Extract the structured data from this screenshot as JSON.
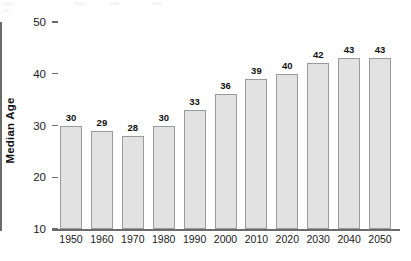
{
  "chart_data": {
    "type": "bar",
    "title": "",
    "xlabel": "",
    "ylabel": "Median Age",
    "categories": [
      "1950",
      "1960",
      "1970",
      "1980",
      "1990",
      "2000",
      "2010",
      "2020",
      "2030",
      "2040",
      "2050"
    ],
    "values": [
      30,
      29,
      28,
      30,
      33,
      36,
      39,
      40,
      42,
      43,
      43
    ],
    "ylim": [
      10,
      50
    ],
    "ytick_labels": [
      "10",
      "20",
      "30",
      "40",
      "50"
    ],
    "ytick_values": [
      10,
      20,
      30,
      40,
      50
    ],
    "grid": false,
    "legend": null,
    "data_labels_shown": true,
    "bar_fill_color": "#e2e2e2",
    "bar_border_color": "#9a9a9a",
    "axis_color": "#6b6b6b",
    "text_color": "#1a1a1a",
    "background_color": "#ffffff"
  }
}
